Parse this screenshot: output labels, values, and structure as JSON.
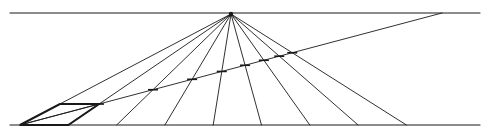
{
  "diagram": {
    "type": "perspective-construction",
    "colors": {
      "background": "#ffffff",
      "ink": "#1a1a1a"
    },
    "elements": {
      "horizon_line": "horizon",
      "ground_line": "picture-plane base",
      "vanishing_point": "central vanishing point",
      "orthogonals_count": 9,
      "diagonal": "distance-point diagonal",
      "square": "foreshortened square",
      "depth_marks_count": 8
    },
    "text_labels": []
  }
}
